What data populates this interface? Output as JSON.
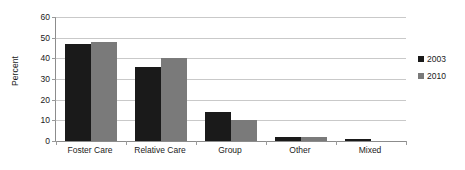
{
  "chart_data": {
    "type": "bar",
    "title": "",
    "subtitle": "",
    "xlabel": "",
    "ylabel": "Percent",
    "categories": [
      "Foster Care",
      "Relative Care",
      "Group",
      "Other",
      "Mixed"
    ],
    "series": [
      {
        "name": "2003",
        "color": "#1a1a1a",
        "values": [
          47,
          36,
          14,
          2,
          1
        ]
      },
      {
        "name": "2010",
        "color": "#7a7a7a",
        "values": [
          48,
          40,
          10,
          2,
          0
        ]
      }
    ],
    "ylim": [
      0,
      60
    ],
    "ytick_values": [
      0,
      10,
      20,
      30,
      40,
      50,
      60
    ],
    "ytick_labels": [
      "0",
      "10",
      "20",
      "30",
      "40",
      "50",
      "60"
    ],
    "grid": true,
    "grid_axis": "y",
    "legend_position": "right",
    "orientation": "vertical",
    "grouping": "grouped"
  },
  "axes": {
    "y_title": "Percent",
    "y_tick_labels": [
      "60",
      "50",
      "40",
      "30",
      "20",
      "10",
      "0"
    ],
    "x_tick_labels": [
      "Foster Care",
      "Relative Care",
      "Group",
      "Other",
      "Mixed"
    ]
  },
  "legend": {
    "items": [
      {
        "label": "2003",
        "color": "#1a1a1a"
      },
      {
        "label": "2010",
        "color": "#7a7a7a"
      }
    ]
  },
  "colors": {
    "series_2003": "#1a1a1a",
    "series_2010": "#7a7a7a",
    "gridline": "#c9c9c9",
    "axis": "#8c8c8c",
    "text": "#1a1a1a",
    "background": "#ffffff"
  }
}
